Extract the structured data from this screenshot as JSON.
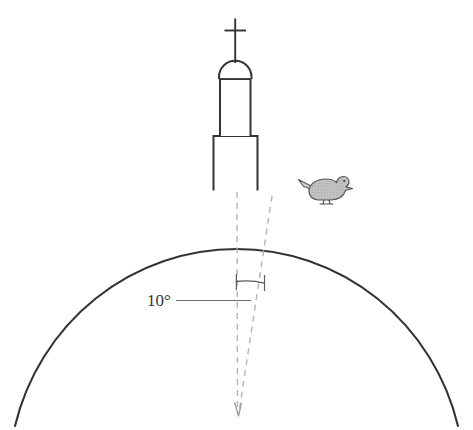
{
  "figure": {
    "background_color": "#ffffff",
    "stroke_color": "#333333",
    "dashed_stroke_color": "#b0b0b0",
    "bird_fill_color": "#b9b9b9",
    "bird_outline_color": "#555555"
  },
  "annotations": {
    "angle_label": "10°",
    "angle_value": 10,
    "angle_unit": "degrees"
  },
  "elements": {
    "sphere_name": "earth-arc",
    "tower_name": "church-tower",
    "cross_name": "cross-finial",
    "bird_name": "bird-pigeon",
    "radius_center_line": "vertical-dashed-radius",
    "radius_slanted_line": "slanted-dashed-radius",
    "arc_marker": "angle-arc-marker",
    "leader_line": "angle-leader-line"
  },
  "geometry": {
    "arc_apex_x": 237,
    "arc_apex_y": 192,
    "arc_left_x": 15,
    "arc_right_x": 458,
    "arc_bottom_y": 425,
    "vertex_x": 237,
    "vertex_y": 415,
    "tower_base_left": 213,
    "tower_base_right": 258,
    "tower_base_top": 135,
    "tower_shaft_left": 219,
    "tower_shaft_right": 251,
    "tower_shaft_top": 78,
    "dome_top_y": 62,
    "cross_top_y": 18
  }
}
